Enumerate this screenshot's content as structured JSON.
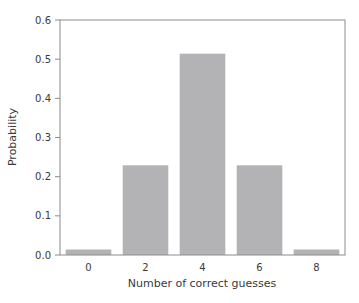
{
  "chart_data": {
    "type": "bar",
    "title": "",
    "xlabel": "Number of correct guesses",
    "ylabel": "Probability",
    "categories": [
      "0",
      "2",
      "4",
      "6",
      "8"
    ],
    "values": [
      0.014,
      0.229,
      0.514,
      0.229,
      0.014
    ],
    "ylim": [
      0.0,
      0.6
    ],
    "yticks": [
      "0.0",
      "0.1",
      "0.2",
      "0.3",
      "0.4",
      "0.5",
      "0.6"
    ],
    "xticks": [
      "0",
      "2",
      "4",
      "6",
      "8"
    ],
    "grid": false,
    "legend": null,
    "colors": {
      "bar": "#b3b3b5",
      "axis": "#8c8c8c",
      "text": "#3a3a3a"
    }
  }
}
